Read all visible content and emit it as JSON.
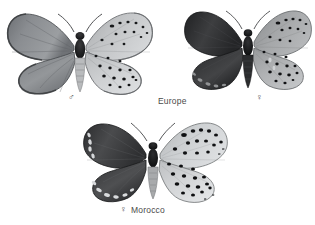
{
  "plate": {
    "background_color": "#ffffff",
    "medium": "grayscale halftone photographic plate",
    "subject": "butterfly specimens, upperside at left and underside at right"
  },
  "specimens": [
    {
      "id": "specimen-male-europe",
      "sex_symbol": "♂",
      "sex_name": "male",
      "locality": "Europe",
      "position": {
        "x": 4,
        "y": 6,
        "width": 148,
        "height": 92
      },
      "upperside": {
        "side": "left",
        "base_color": "#8c8f93",
        "edge_color": "#58595c",
        "tone": "medium grey, pale silvery wash with dark veins and dark outer border"
      },
      "underside": {
        "side": "right",
        "base_color": "#b9bbbd",
        "ground": "pale grey",
        "forewing_spot_rows": 2,
        "hindwing_spot_rows": 3,
        "spot_color": "#16181a",
        "fringe": "chequered white and grey"
      }
    },
    {
      "id": "specimen-female-europe",
      "sex_symbol": "♀",
      "sex_name": "female",
      "locality": "Europe",
      "position": {
        "x": 182,
        "y": 4,
        "width": 130,
        "height": 92
      },
      "upperside": {
        "side": "left",
        "base_color": "#3a3a3c",
        "edge_color": "#1d1e20",
        "tone": "very dark sooty brown, near black, faint pale marginal lunules on hindwing"
      },
      "underside": {
        "side": "right",
        "base_color": "#9a9c9e",
        "ground": "grey brown",
        "forewing_spot_rows": 2,
        "hindwing_spot_rows": 3,
        "spot_color": "#131416",
        "fringe": "chequered"
      }
    },
    {
      "id": "specimen-female-morocco",
      "sex_symbol": "♀",
      "sex_name": "female",
      "locality": "Morocco",
      "position": {
        "x": 80,
        "y": 118,
        "width": 150,
        "height": 88
      },
      "upperside": {
        "side": "left",
        "base_color": "#48484a",
        "edge_color": "#222325",
        "tone": "dark slate grey with conspicuous pale cream marginal lunules"
      },
      "underside": {
        "side": "right",
        "base_color": "#c6c8ca",
        "ground": "pale whitish grey",
        "forewing_spot_rows": 2,
        "hindwing_spot_rows": 3,
        "spot_color": "#0f1012",
        "spot_size": "large and bold",
        "fringe": "chequered white and dark"
      }
    }
  ],
  "labels": {
    "europe": "Europe",
    "morocco": "Morocco",
    "male_symbol": "♂",
    "female_symbol": "♀"
  }
}
